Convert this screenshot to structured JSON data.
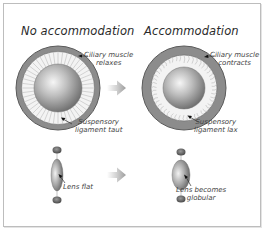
{
  "diagram": {
    "panels": [
      {
        "title": "No accommodation",
        "ciliary_label": [
          "Ciliary muscle",
          "relaxes"
        ],
        "ligament_label": [
          "Suspensory",
          "ligament taut"
        ],
        "lens_label": [
          "Lens flat"
        ]
      },
      {
        "title": "Accommodation",
        "ciliary_label": [
          "Ciliary muscle",
          "contracts"
        ],
        "ligament_label": [
          "Suspensory",
          "ligament lax"
        ],
        "lens_label": [
          "Lens becomes",
          "globular"
        ]
      }
    ],
    "arrows": [
      "transition-arrow-top",
      "transition-arrow-bottom"
    ],
    "colors": {
      "ring": "#8a8a8a",
      "ring_dark": "#555555",
      "fibers": "#d8d8d8",
      "lens_light": "#f4f4f4",
      "lens_dark": "#7a7a7a",
      "arrow": "#b5b5b5",
      "border": "#bdbdbd"
    }
  }
}
